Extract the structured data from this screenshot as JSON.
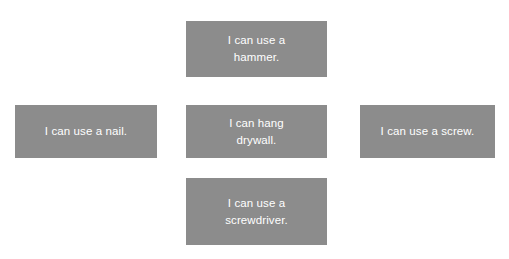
{
  "diagram": {
    "type": "concept-cluster",
    "layout": "cross",
    "background_color": "#ffffff",
    "node_fill_color": "#8c8c8c",
    "node_text_color": "#ffffff",
    "nodes": [
      {
        "id": "hammer",
        "position": "top",
        "text": "I can use a\nhammer.",
        "text_plain": "I can use a hammer."
      },
      {
        "id": "nail",
        "position": "left",
        "text": "I can use a nail.",
        "text_plain": "I can use a nail."
      },
      {
        "id": "drywall",
        "position": "center",
        "text": "I can hang\ndrywall.",
        "text_plain": "I can hang drywall."
      },
      {
        "id": "screw",
        "position": "right",
        "text": "I can use a screw.",
        "text_plain": "I can use a screw."
      },
      {
        "id": "screwdriver",
        "position": "bottom",
        "text": "I can use a\nscrewdriver.",
        "text_plain": "I can use a screwdriver."
      }
    ]
  }
}
